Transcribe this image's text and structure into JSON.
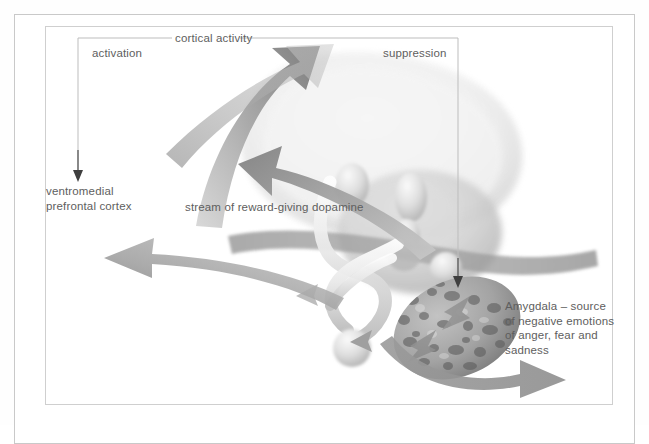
{
  "figure": {
    "type": "anatomical-diagram",
    "background_color": "#ffffff",
    "frame_color": "#c9c9c9",
    "text_color": "#5e5e5e",
    "arrow_color": "#8c8c8c"
  },
  "labels": {
    "cortical_activity": "cortical activity",
    "activation": "activation",
    "suppression": "suppression",
    "ventromedial_prefrontal_cortex": "ventromedial\nprefrontal cortex",
    "dopamine_stream": "stream of reward-giving dopamine",
    "amygdala": "Amygdala – source\nof negative emotions\nof anger, fear and\nsadness"
  },
  "structures": [
    {
      "name": "cerebral-cortex",
      "shade": "#ededed"
    },
    {
      "name": "thalamus",
      "shade": "#d2d2d2"
    },
    {
      "name": "amygdala",
      "shade": "#9e9e9e",
      "texture": "mottled"
    },
    {
      "name": "hippocampus-tube",
      "shade": "#e4e4e4"
    },
    {
      "name": "brainstem-band",
      "shade": "#a8a8a8"
    }
  ],
  "arrows": [
    {
      "name": "activation-pointer",
      "direction": "down",
      "style": "thin"
    },
    {
      "name": "suppression-pointer",
      "direction": "down",
      "style": "thin"
    },
    {
      "name": "cortical-activation-arrow",
      "direction": "up-right",
      "style": "thick"
    },
    {
      "name": "dopamine-stream-arrow",
      "direction": "up-left",
      "style": "thick"
    },
    {
      "name": "vmpfc-output-arrow",
      "direction": "left",
      "style": "thick"
    },
    {
      "name": "amygdala-output-arrow",
      "direction": "right",
      "style": "thick"
    }
  ]
}
